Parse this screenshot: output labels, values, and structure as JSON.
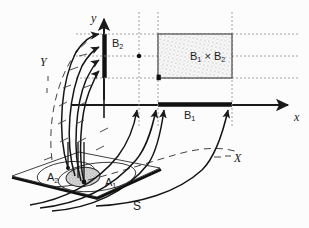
{
  "figure": {
    "name": "preimage-product-diagram",
    "background_color": "#fcfcfc",
    "ink_color": "#1a1a1a",
    "width": 309,
    "height": 228
  },
  "axes": {
    "y_label": "y",
    "x_label": "x",
    "y_axis_name": "vertical-axis",
    "x_axis_name": "horizontal-axis"
  },
  "space_labels": {
    "domain_curve_left": "Y",
    "domain_curve_right": "X",
    "source_plane": "S"
  },
  "sets": {
    "b2": {
      "label": "B",
      "subscript": "2"
    },
    "b1": {
      "label": "B",
      "subscript": "1"
    },
    "product": {
      "label": "B",
      "sub1": "1",
      "times": " × ",
      "label2": "B",
      "sub2": "2"
    },
    "a1": {
      "label": "A",
      "subscript": "1"
    },
    "a2": {
      "label": "A",
      "subscript": "2"
    }
  },
  "style": {
    "thick_segment_color": "#111111",
    "stipple_fill_color": "#f2f2f2",
    "dotted_guide_color": "#8c8c8c",
    "dashed_curve_color": "#444444"
  }
}
